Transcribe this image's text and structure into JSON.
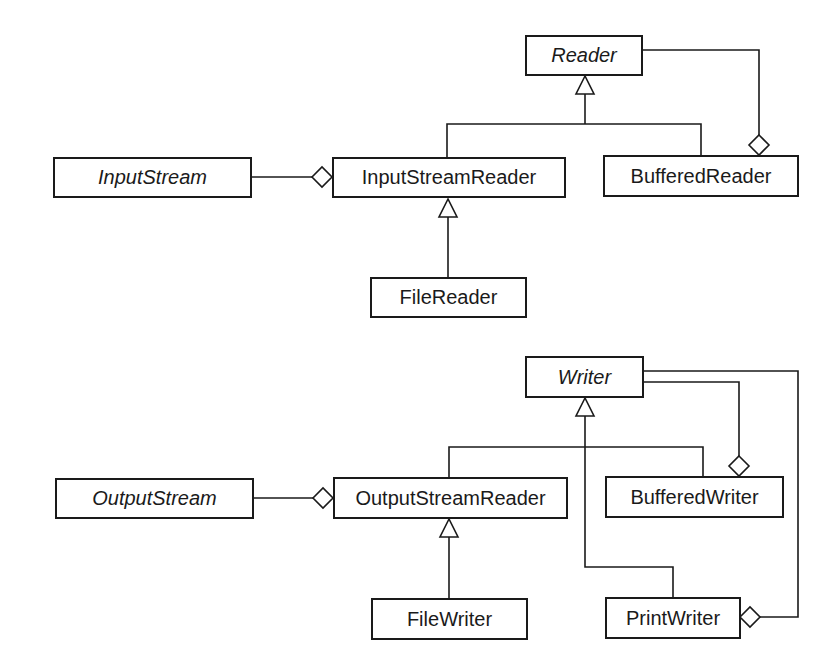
{
  "diagram": {
    "type": "UML class diagram",
    "reader_hierarchy": {
      "classes": [
        {
          "id": "reader",
          "label": "Reader",
          "abstract": true
        },
        {
          "id": "input_stream",
          "label": "InputStream",
          "abstract": true
        },
        {
          "id": "input_stream_reader",
          "label": "InputStreamReader",
          "abstract": false
        },
        {
          "id": "buffered_reader",
          "label": "BufferedReader",
          "abstract": false
        },
        {
          "id": "file_reader",
          "label": "FileReader",
          "abstract": false
        }
      ],
      "relationships": [
        {
          "type": "generalization",
          "from": "InputStreamReader",
          "to": "Reader"
        },
        {
          "type": "generalization",
          "from": "BufferedReader",
          "to": "Reader"
        },
        {
          "type": "generalization",
          "from": "FileReader",
          "to": "InputStreamReader"
        },
        {
          "type": "aggregation",
          "whole": "InputStreamReader",
          "part": "InputStream"
        },
        {
          "type": "aggregation",
          "whole": "BufferedReader",
          "part": "Reader"
        }
      ]
    },
    "writer_hierarchy": {
      "classes": [
        {
          "id": "writer",
          "label": "Writer",
          "abstract": true
        },
        {
          "id": "output_stream",
          "label": "OutputStream",
          "abstract": true
        },
        {
          "id": "output_stream_reader",
          "label": "OutputStreamReader",
          "abstract": false
        },
        {
          "id": "buffered_writer",
          "label": "BufferedWriter",
          "abstract": false
        },
        {
          "id": "file_writer",
          "label": "FileWriter",
          "abstract": false
        },
        {
          "id": "print_writer",
          "label": "PrintWriter",
          "abstract": false
        }
      ],
      "relationships": [
        {
          "type": "generalization",
          "from": "OutputStreamReader",
          "to": "Writer"
        },
        {
          "type": "generalization",
          "from": "BufferedWriter",
          "to": "Writer"
        },
        {
          "type": "generalization",
          "from": "PrintWriter",
          "to": "Writer"
        },
        {
          "type": "generalization",
          "from": "FileWriter",
          "to": "OutputStreamReader"
        },
        {
          "type": "aggregation",
          "whole": "OutputStreamReader",
          "part": "OutputStream"
        },
        {
          "type": "aggregation",
          "whole": "BufferedWriter",
          "part": "Writer"
        },
        {
          "type": "aggregation",
          "whole": "PrintWriter",
          "part": "Writer"
        }
      ]
    },
    "colors": {
      "line": "#1a1a1a",
      "background": "#ffffff"
    }
  }
}
